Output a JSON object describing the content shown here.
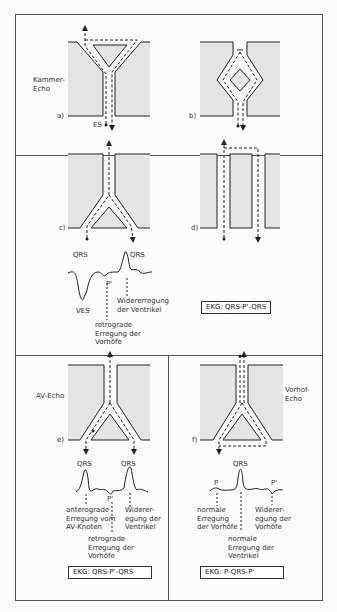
{
  "figure": {
    "colors": {
      "tissue_fill": "#e4e4e4",
      "line": "#222222",
      "frame": "#555555"
    },
    "panels": {
      "a": {
        "label": "a)",
        "side_label": "Kammer-\nEcho",
        "marker": "ES"
      },
      "b": {
        "label": "b)"
      },
      "c": {
        "label": "c)"
      },
      "d": {
        "label": "d)"
      },
      "e": {
        "label": "e)",
        "side_label": "AV-Echo"
      },
      "f": {
        "label": "f)",
        "side_label": "Vorhof-\nEcho"
      }
    },
    "ekg_cd": {
      "peaks": {
        "qrs1": "QRS",
        "qrs2": "QRS",
        "p_prime": "P'",
        "ves": "VES"
      },
      "annotations": {
        "wider": "Widererregung\nder Ventrikel",
        "retro": "retrograde\nErregung der\nVorhöfe"
      },
      "box": "EKG: QRS-P'-QRS"
    },
    "ekg_e": {
      "peaks": {
        "qrs1": "QRS",
        "qrs2": "QRS",
        "p_prime": "P'"
      },
      "annotations": {
        "antero": "anterograde\nErregung vom\nAV-Knoten",
        "wider": "Widerer-\negung der\nVentrikel",
        "retro": "retrograde\nErregung der\nVorhöfe"
      },
      "box": "EKG: QRS-P'-QRS"
    },
    "ekg_f": {
      "peaks": {
        "qrs": "QRS",
        "p": "P",
        "p_prime": "P'"
      },
      "annotations": {
        "normal_v": "normale\nErregung\nder Vorhöfe",
        "wider": "Widerer-\negung der\nVorhöfe",
        "normal_k": "normale\nErregung der\nVentrikel"
      },
      "box": "EKG: P-QRS-P'"
    }
  }
}
